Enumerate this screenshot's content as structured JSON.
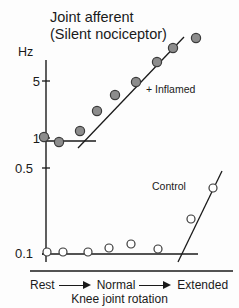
{
  "title": {
    "line1": "Joint afferent",
    "line2": "(Silent nociceptor)"
  },
  "axes": {
    "y_unit_label": "Hz",
    "y_ticks": [
      "5",
      "1",
      "0.5",
      "0.1"
    ],
    "x_steps": [
      "Rest",
      "Normal",
      "Extended"
    ],
    "x_caption": "Knee joint rotation"
  },
  "legend": {
    "inflamed": "+ Inflamed",
    "control": "Control"
  },
  "colors": {
    "axis": "#1a1a1a",
    "inflamed_fill": "#8c8c8c",
    "inflamed_stroke": "#3a3a3a",
    "control_fill": "#ffffff",
    "control_stroke": "#3a3a3a",
    "text": "#1a1a1a"
  },
  "chart_data": {
    "type": "scatter",
    "xlabel": "Knee joint rotation",
    "ylabel": "Hz",
    "y_scale": "log",
    "ylim": [
      0.1,
      10
    ],
    "y_tick_values": [
      5,
      1,
      0.5,
      0.1
    ],
    "x_categories": [
      "Rest",
      "Normal",
      "Extended"
    ],
    "grid": false,
    "legend_position": "inline-annotation",
    "series": [
      {
        "name": "+ Inflamed",
        "marker": "filled-circle",
        "points": [
          {
            "x": 44,
            "y": 137,
            "value": 1.05
          },
          {
            "x": 59,
            "y": 142,
            "value": 0.95
          },
          {
            "x": 80,
            "y": 131,
            "value": 1.2
          },
          {
            "x": 97,
            "y": 111,
            "value": 1.8
          },
          {
            "x": 115,
            "y": 95,
            "value": 2.5
          },
          {
            "x": 136,
            "y": 82,
            "value": 3.4
          },
          {
            "x": 157,
            "y": 62,
            "value": 5.6
          },
          {
            "x": 173,
            "y": 48,
            "value": 7.6
          },
          {
            "x": 196,
            "y": 38,
            "value": 9.5
          }
        ],
        "baseline": {
          "x1": 42,
          "x2": 96,
          "y": 141
        },
        "trend": {
          "x1": 78,
          "y1": 148,
          "x2": 184,
          "y2": 37
        }
      },
      {
        "name": "Control",
        "marker": "open-circle",
        "points": [
          {
            "x": 47,
            "y": 252,
            "value": 0.12
          },
          {
            "x": 63,
            "y": 252,
            "value": 0.12
          },
          {
            "x": 88,
            "y": 252,
            "value": 0.12
          },
          {
            "x": 109,
            "y": 248,
            "value": 0.13
          },
          {
            "x": 131,
            "y": 244,
            "value": 0.14
          },
          {
            "x": 158,
            "y": 249,
            "value": 0.13
          },
          {
            "x": 191,
            "y": 219,
            "value": 0.21
          },
          {
            "x": 213,
            "y": 188,
            "value": 0.42
          }
        ],
        "baseline": {
          "x1": 42,
          "x2": 198,
          "y": 254
        },
        "trend": {
          "x1": 178,
          "y1": 262,
          "x2": 222,
          "y2": 171
        }
      }
    ]
  }
}
